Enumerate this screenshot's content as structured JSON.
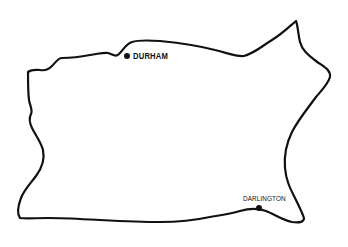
{
  "map": {
    "region_outline": "county-boundary",
    "stroke_color": "#111111",
    "background_color": "#ffffff",
    "towns": [
      {
        "name": "DURHAM",
        "marker": "filled-circle"
      },
      {
        "name": "DARLINGTON",
        "marker": "filled-circle"
      }
    ]
  }
}
